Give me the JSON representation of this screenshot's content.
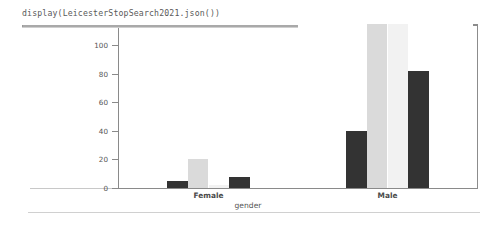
{
  "notebook": {
    "code_cell": "display(LeicesterStopSearch2021.json())"
  },
  "chart_data": {
    "type": "bar",
    "title": "",
    "xlabel": "gender",
    "ylabel": "",
    "categories": [
      "Female",
      "Male"
    ],
    "ylim": [
      0,
      110
    ],
    "yticks": [
      0,
      20,
      40,
      60,
      80,
      100
    ],
    "grid": false,
    "legend": "none",
    "series": [
      {
        "name": "series-1",
        "color": "#333333",
        "values": [
          5,
          40
        ]
      },
      {
        "name": "series-2",
        "color": "#dadada",
        "values": [
          20,
          118
        ]
      },
      {
        "name": "series-3",
        "color": "#f2f2f2",
        "values": [
          2,
          115
        ]
      },
      {
        "name": "series-4",
        "color": "#333333",
        "values": [
          8,
          82
        ]
      }
    ]
  },
  "colors": {
    "axis": "#8a8a8a",
    "text": "#555555",
    "frame": "#9a9a9a",
    "background": "#ffffff"
  }
}
